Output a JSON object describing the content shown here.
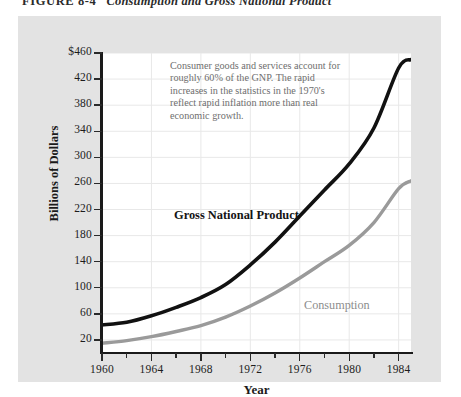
{
  "caption": {
    "figure_number": "FIGURE 8-4",
    "title": "Consumption and Gross National Product"
  },
  "chart_data": {
    "type": "line",
    "title": "Consumption and Gross National Product",
    "xlabel": "Year",
    "ylabel": "Billions of Dollars",
    "xlim": [
      1960,
      1985
    ],
    "ylim": [
      0,
      460
    ],
    "grid": true,
    "legend": "inline-labels",
    "x_ticks": [
      1960,
      1964,
      1968,
      1972,
      1976,
      1980,
      1984
    ],
    "x_minor_ticks": [
      1962,
      1966,
      1970,
      1974,
      1978,
      1982
    ],
    "y_ticks": [
      20,
      60,
      100,
      140,
      180,
      220,
      260,
      300,
      340,
      380,
      420,
      460
    ],
    "y_tick_labels": [
      "20",
      "60",
      "100",
      "140",
      "180",
      "220",
      "260",
      "300",
      "340",
      "380",
      "420",
      "$460"
    ],
    "x": [
      1960,
      1962,
      1964,
      1966,
      1968,
      1970,
      1972,
      1974,
      1976,
      1978,
      1980,
      1982,
      1984,
      1985
    ],
    "series": [
      {
        "name": "Gross National Product",
        "color": "#111111",
        "values": [
          43,
          47,
          57,
          70,
          85,
          105,
          135,
          170,
          210,
          250,
          290,
          345,
          437,
          450
        ]
      },
      {
        "name": "Consumption",
        "color": "#9a9a9a",
        "values": [
          15,
          19,
          25,
          33,
          42,
          55,
          72,
          92,
          115,
          140,
          165,
          200,
          252,
          264
        ]
      }
    ],
    "annotation": "Consumer goods and services account for roughly 60% of the GNP. The rapid increases in the statistics in the 1970's reflect rapid inflation more than real economic growth."
  },
  "colors": {
    "panel_background": "#e3e3e3",
    "plot_background": "#ffffff",
    "axis": "#1a1a1a",
    "grid": "#e8e8e8",
    "gnp_line": "#111111",
    "consumption_line": "#9a9a9a",
    "annotation_text": "#6e6e6e"
  }
}
